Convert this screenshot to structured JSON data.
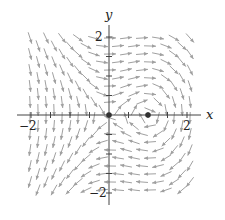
{
  "chart_data": {
    "type": "vector_field",
    "title": "",
    "field": {
      "dx": "y",
      "dy": "x - x^2"
    },
    "xlabel": "x",
    "ylabel": "y",
    "xlim": [
      -2.3,
      2.3
    ],
    "ylim": [
      -2.3,
      2.3
    ],
    "x_ticks": [
      {
        "value": -2,
        "label": "−2"
      },
      {
        "value": 2,
        "label": "2"
      }
    ],
    "y_ticks": [
      {
        "value": 2,
        "label": "2"
      },
      {
        "value": -2,
        "label": "−2"
      }
    ],
    "minor_tick_step": 0.5,
    "critical_points": [
      {
        "x": 0,
        "y": 0
      },
      {
        "x": 1,
        "y": 0
      }
    ],
    "grid": false,
    "arrow_color": "#a0a0a0",
    "axis_color": "#444444"
  },
  "layout": {
    "origin_px": [
      109,
      115
    ],
    "px_per_unit": 39,
    "x_axis_px": [
      17,
      201
    ],
    "y_axis_px": [
      25,
      205
    ],
    "grid_step_px": 16,
    "grid_x_range_px": [
      30,
      192
    ],
    "grid_y_range_px": [
      38,
      196
    ],
    "arrow_len_px": 12
  }
}
